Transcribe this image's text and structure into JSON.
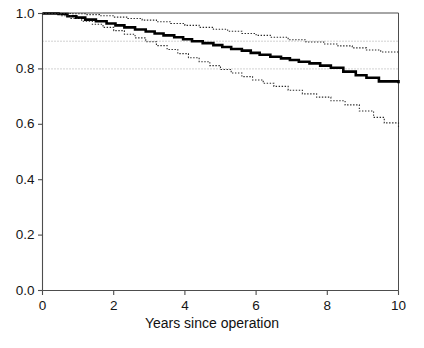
{
  "chart_data": {
    "type": "line",
    "title": "",
    "subtitle": "",
    "xlabel": "Years since operation",
    "ylabel": "",
    "xlim": [
      0,
      10
    ],
    "ylim": [
      0.0,
      1.0
    ],
    "xticks": [
      0,
      2,
      4,
      6,
      8,
      10
    ],
    "xtick_labels": [
      "0",
      "2",
      "4",
      "6",
      "8",
      "10"
    ],
    "yticks": [
      0.0,
      0.2,
      0.4,
      0.6,
      0.8,
      1.0
    ],
    "ytick_labels": [
      "0.0",
      "0.2",
      "0.4",
      "0.6",
      "0.8",
      "1.0"
    ],
    "grid": "horizontal dotted reference lines at 0.8 and 0.9 only",
    "gridlines_y": [
      0.8,
      0.9
    ],
    "legend": "none",
    "style": "Kaplan-Meier survival step curves; solid bold estimate with dotted 95% confidence limits",
    "series": [
      {
        "name": "Survival estimate",
        "style": "solid",
        "linewidth": 2.6,
        "color": "#000000",
        "step": "post",
        "x": [
          0,
          0.45,
          0.7,
          0.95,
          1.2,
          1.5,
          1.8,
          2.05,
          2.3,
          2.6,
          2.9,
          3.15,
          3.4,
          3.7,
          3.95,
          4.2,
          4.5,
          4.8,
          5.05,
          5.3,
          5.6,
          5.85,
          6.1,
          6.4,
          6.7,
          6.95,
          7.2,
          7.5,
          7.8,
          8.1,
          8.45,
          8.8,
          9.1,
          9.45,
          10
        ],
        "y": [
          1.0,
          0.998,
          0.99,
          0.985,
          0.978,
          0.972,
          0.964,
          0.957,
          0.95,
          0.942,
          0.935,
          0.928,
          0.921,
          0.914,
          0.907,
          0.9,
          0.893,
          0.886,
          0.879,
          0.872,
          0.866,
          0.858,
          0.851,
          0.844,
          0.838,
          0.832,
          0.826,
          0.82,
          0.812,
          0.804,
          0.79,
          0.777,
          0.768,
          0.755,
          0.748
        ]
      },
      {
        "name": "Upper 95% confidence limit",
        "style": "dotted",
        "linewidth": 1.1,
        "color": "#2b2b2b",
        "step": "post",
        "x": [
          0,
          0.5,
          0.85,
          1.2,
          1.6,
          2.0,
          2.4,
          2.8,
          3.2,
          3.6,
          4.0,
          4.4,
          4.8,
          5.2,
          5.6,
          6.0,
          6.4,
          6.9,
          7.4,
          7.9,
          8.3,
          8.7,
          9.1,
          9.5,
          10
        ],
        "y": [
          1.0,
          1.0,
          0.999,
          0.996,
          0.992,
          0.987,
          0.982,
          0.976,
          0.97,
          0.964,
          0.957,
          0.95,
          0.943,
          0.936,
          0.928,
          0.921,
          0.914,
          0.905,
          0.897,
          0.89,
          0.883,
          0.876,
          0.868,
          0.861,
          0.855
        ]
      },
      {
        "name": "Lower 95% confidence limit",
        "style": "dotted",
        "linewidth": 1.1,
        "color": "#2b2b2b",
        "step": "post",
        "x": [
          0,
          0.5,
          0.8,
          1.1,
          1.4,
          1.7,
          2.0,
          2.3,
          2.6,
          2.9,
          3.2,
          3.5,
          3.8,
          4.1,
          4.4,
          4.7,
          5.0,
          5.3,
          5.6,
          5.9,
          6.2,
          6.5,
          6.9,
          7.3,
          7.7,
          8.1,
          8.5,
          8.9,
          9.3,
          9.6,
          10
        ],
        "y": [
          1.0,
          0.992,
          0.982,
          0.972,
          0.961,
          0.95,
          0.938,
          0.925,
          0.912,
          0.898,
          0.884,
          0.87,
          0.855,
          0.84,
          0.826,
          0.812,
          0.798,
          0.785,
          0.772,
          0.76,
          0.748,
          0.737,
          0.723,
          0.71,
          0.698,
          0.685,
          0.67,
          0.648,
          0.625,
          0.605,
          0.59
        ]
      }
    ]
  },
  "axes": {
    "x_title": "Years since operation"
  },
  "colors": {
    "axis": "#4d4d4d",
    "main_curve": "#000000",
    "ci_curve": "#2b2b2b",
    "gridline": "#9a9a9a",
    "background": "#ffffff"
  }
}
